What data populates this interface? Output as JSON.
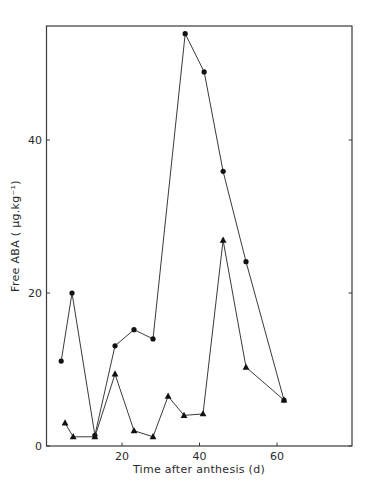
{
  "chart_data": {
    "type": "line",
    "title": "",
    "xlabel": "Time after anthesis (d)",
    "ylabel": "Free ABA ( μg.kg⁻¹)",
    "xlim": [
      0,
      79
    ],
    "ylim": [
      0,
      55
    ],
    "xticks": [
      20,
      40,
      60
    ],
    "yticks": [
      0,
      20,
      40
    ],
    "grid": false,
    "legend": null,
    "series": [
      {
        "name": "circles",
        "marker": "circle",
        "x": [
          4.3,
          7.1,
          13.0,
          18.2,
          23.1,
          28.0,
          36.3,
          41.2,
          46.1,
          52.0,
          61.8
        ],
        "values": [
          11.1,
          20.0,
          1.4,
          13.1,
          15.2,
          14.0,
          53.9,
          48.9,
          35.9,
          24.1,
          6.0
        ]
      },
      {
        "name": "triangles",
        "marker": "triangle",
        "x": [
          5.3,
          7.4,
          13.0,
          18.2,
          23.1,
          28.0,
          31.9,
          36.0,
          40.9,
          46.1,
          52.0,
          61.8
        ],
        "values": [
          3.0,
          1.2,
          1.2,
          9.4,
          2.0,
          1.2,
          6.5,
          4.0,
          4.2,
          26.9,
          10.3,
          6.0
        ]
      }
    ]
  },
  "axes": {
    "x_title": "Time after anthesis (d)",
    "y_title": "Free ABA ( μg.kg⁻¹)",
    "x_tick_labels": [
      "20",
      "40",
      "60"
    ],
    "y_tick_labels": [
      "0",
      "20",
      "40"
    ]
  }
}
